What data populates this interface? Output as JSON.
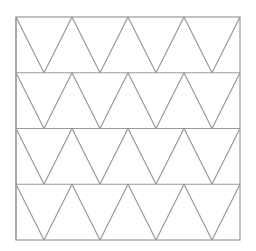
{
  "diagram": {
    "type": "triangular-grid",
    "square": {
      "x": 16,
      "y": 17,
      "width": 224,
      "height": 223
    },
    "rows": 4,
    "columns": 4,
    "line_color": "#9a9a9a",
    "background": "#ffffff",
    "line_width": 1.2
  }
}
